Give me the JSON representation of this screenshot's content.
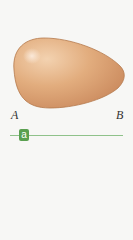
{
  "diagram": {
    "shape": "egg",
    "colors": {
      "fill_light": "#e8b88a",
      "fill_dark": "#c98a58",
      "outline": "#b57a4c",
      "slider": "#5aa050",
      "track": "#8fc28a"
    },
    "labels": {
      "left": "A",
      "right": "B"
    }
  },
  "slider": {
    "label": "a"
  }
}
